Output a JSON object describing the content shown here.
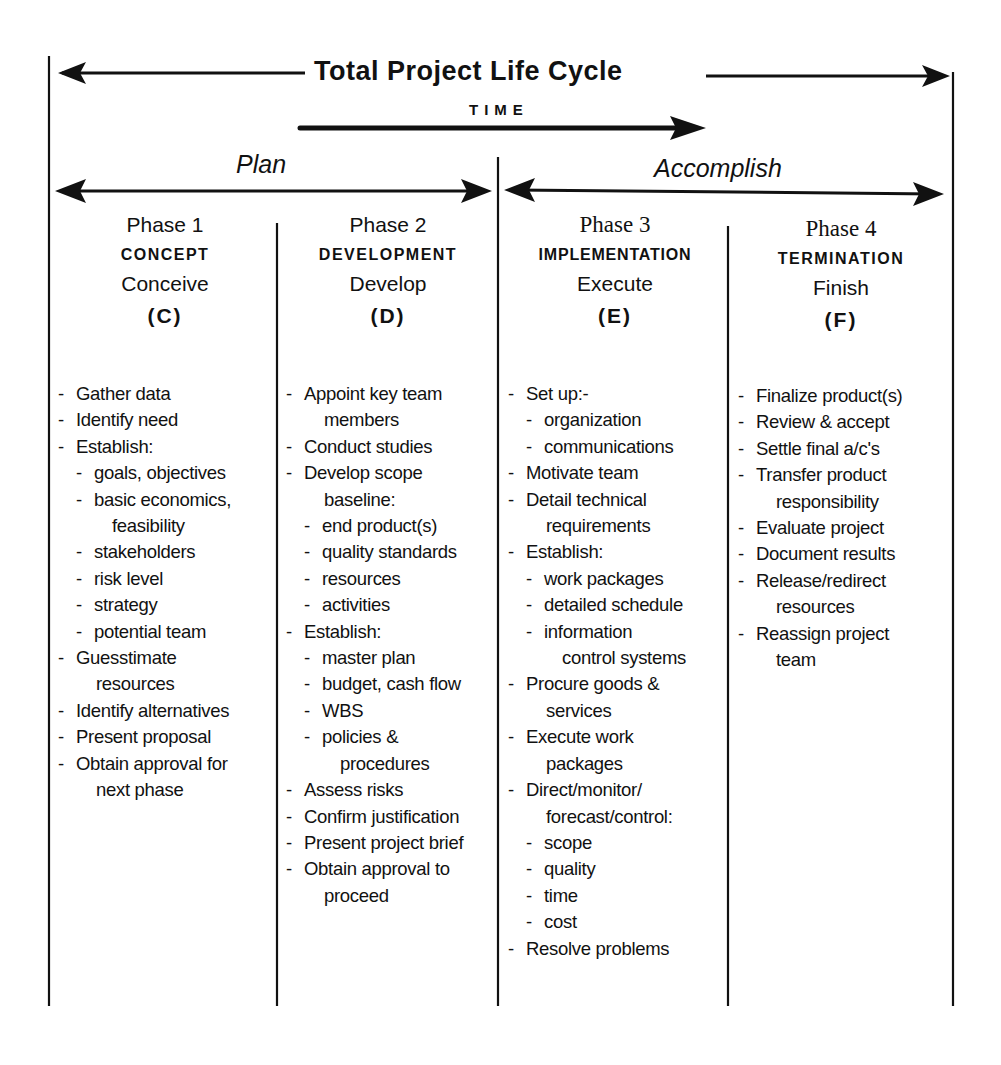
{
  "header": {
    "title": "Total Project Life Cycle",
    "time_label": "TIME"
  },
  "eras": {
    "plan": "Plan",
    "accomplish": "Accomplish"
  },
  "phases": [
    {
      "number": "Phase 1",
      "name": "CONCEPT",
      "verb": "Conceive",
      "code": "(C)",
      "tasks": [
        {
          "text": "Gather data",
          "level": 0
        },
        {
          "text": "Identify need",
          "level": 0
        },
        {
          "text": "Establish:",
          "level": 0
        },
        {
          "text": "goals, objectives",
          "level": 1
        },
        {
          "text": "basic economics,",
          "level": 1
        },
        {
          "text": "feasibility",
          "level": 1,
          "cont": true
        },
        {
          "text": "stakeholders",
          "level": 1
        },
        {
          "text": "risk level",
          "level": 1
        },
        {
          "text": "strategy",
          "level": 1
        },
        {
          "text": "potential team",
          "level": 1
        },
        {
          "text": "Guesstimate",
          "level": 0
        },
        {
          "text": "resources",
          "level": 0,
          "cont": true
        },
        {
          "text": "Identify alternatives",
          "level": 0
        },
        {
          "text": "Present proposal",
          "level": 0
        },
        {
          "text": "Obtain approval for",
          "level": 0
        },
        {
          "text": "next phase",
          "level": 0,
          "cont": true
        }
      ]
    },
    {
      "number": "Phase 2",
      "name": "DEVELOPMENT",
      "verb": "Develop",
      "code": "(D)",
      "tasks": [
        {
          "text": "Appoint key team",
          "level": 0
        },
        {
          "text": "members",
          "level": 0,
          "cont": true
        },
        {
          "text": "Conduct studies",
          "level": 0
        },
        {
          "text": "Develop scope",
          "level": 0
        },
        {
          "text": "baseline:",
          "level": 0,
          "cont": true
        },
        {
          "text": "end product(s)",
          "level": 1
        },
        {
          "text": "quality standards",
          "level": 1
        },
        {
          "text": "resources",
          "level": 1
        },
        {
          "text": "activities",
          "level": 1
        },
        {
          "text": "Establish:",
          "level": 0
        },
        {
          "text": "master plan",
          "level": 1
        },
        {
          "text": "budget, cash flow",
          "level": 1
        },
        {
          "text": "WBS",
          "level": 1
        },
        {
          "text": "policies &",
          "level": 1
        },
        {
          "text": "procedures",
          "level": 1,
          "cont": true
        },
        {
          "text": "Assess risks",
          "level": 0
        },
        {
          "text": "Confirm justification",
          "level": 0
        },
        {
          "text": "Present project brief",
          "level": 0
        },
        {
          "text": "Obtain approval to",
          "level": 0
        },
        {
          "text": "proceed",
          "level": 0,
          "cont": true
        }
      ]
    },
    {
      "number": "Phase 3",
      "name": "IMPLEMENTATION",
      "verb": "Execute",
      "code": "(E)",
      "tasks": [
        {
          "text": "Set up:-",
          "level": 0
        },
        {
          "text": "organization",
          "level": 1
        },
        {
          "text": "communications",
          "level": 1
        },
        {
          "text": "Motivate team",
          "level": 0
        },
        {
          "text": "Detail technical",
          "level": 0
        },
        {
          "text": "requirements",
          "level": 0,
          "cont": true
        },
        {
          "text": "Establish:",
          "level": 0
        },
        {
          "text": "work packages",
          "level": 1
        },
        {
          "text": "detailed schedule",
          "level": 1
        },
        {
          "text": "information",
          "level": 1
        },
        {
          "text": "control systems",
          "level": 1,
          "cont": true
        },
        {
          "text": "Procure goods &",
          "level": 0
        },
        {
          "text": "services",
          "level": 0,
          "cont": true
        },
        {
          "text": "Execute work",
          "level": 0
        },
        {
          "text": "packages",
          "level": 0,
          "cont": true
        },
        {
          "text": "Direct/monitor/",
          "level": 0
        },
        {
          "text": "forecast/control:",
          "level": 0,
          "cont": true
        },
        {
          "text": "scope",
          "level": 1
        },
        {
          "text": "quality",
          "level": 1
        },
        {
          "text": "time",
          "level": 1
        },
        {
          "text": "cost",
          "level": 1
        },
        {
          "text": "Resolve problems",
          "level": 0
        }
      ]
    },
    {
      "number": "Phase 4",
      "name": "TERMINATION",
      "verb": "Finish",
      "code": "(F)",
      "tasks": [
        {
          "text": "Finalize product(s)",
          "level": 0
        },
        {
          "text": "Review & accept",
          "level": 0
        },
        {
          "text": "Settle final a/c's",
          "level": 0
        },
        {
          "text": "Transfer product",
          "level": 0
        },
        {
          "text": "responsibility",
          "level": 0,
          "cont": true
        },
        {
          "text": "Evaluate project",
          "level": 0
        },
        {
          "text": "Document results",
          "level": 0
        },
        {
          "text": "Release/redirect",
          "level": 0
        },
        {
          "text": "resources",
          "level": 0,
          "cont": true
        },
        {
          "text": "Reassign project",
          "level": 0
        },
        {
          "text": "team",
          "level": 0,
          "cont": true
        }
      ]
    }
  ],
  "colors": {
    "ink": "#111111",
    "background": "#ffffff"
  }
}
